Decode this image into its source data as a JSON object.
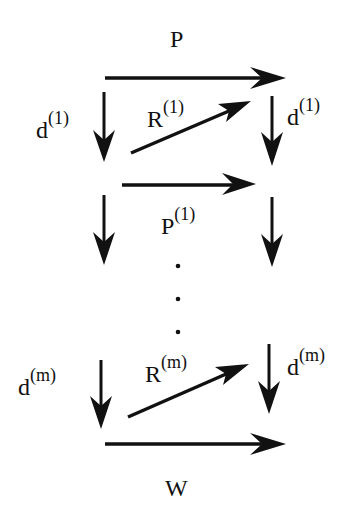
{
  "diagram": {
    "type": "commutative-diagram",
    "stroke_color": "#111111",
    "background": "#ffffff",
    "labels": {
      "top": {
        "base": "P",
        "sup": ""
      },
      "middle": {
        "base": "P",
        "sup": "(1)"
      },
      "bottom": {
        "base": "W",
        "sup": ""
      },
      "diag1": {
        "base": "R",
        "sup": "(1)"
      },
      "diagm": {
        "base": "R",
        "sup": "(m)"
      },
      "left1": {
        "base": "d",
        "sup": "(1)"
      },
      "right1": {
        "base": "d",
        "sup": "(1)"
      },
      "leftm": {
        "base": "d",
        "sup": "(m)"
      },
      "rightm": {
        "base": "d",
        "sup": "(m)"
      }
    },
    "ellipsis": "⋮"
  }
}
